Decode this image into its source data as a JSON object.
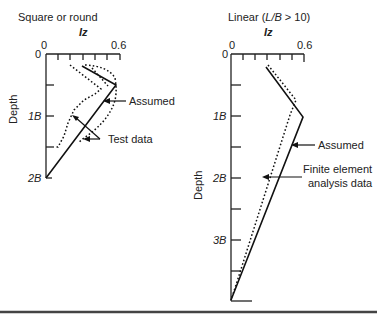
{
  "left_panel": {
    "title": "Square or round",
    "x_axis_label": "Iz",
    "x_ticks": {
      "start": "0",
      "end": "0.6"
    },
    "y_origin_label": "0",
    "y_axis_label": "Depth",
    "y_ticks": [
      "1B",
      "2B"
    ],
    "annotations": {
      "assumed": "Assumed",
      "test_data": "Test data"
    }
  },
  "right_panel": {
    "title": "Linear (L/B > 10)",
    "title_prefix": "Linear (",
    "title_italic": "L/B",
    "title_suffix": " > 10)",
    "x_axis_label": "Iz",
    "x_ticks": {
      "start": "0",
      "end": "0.6"
    },
    "y_origin_label": "0",
    "y_axis_label": "Depth",
    "y_ticks": [
      "1B",
      "2B",
      "3B"
    ],
    "annotations": {
      "assumed": "Assumed",
      "fem_line1": "Finite element",
      "fem_line2": "analysis data"
    }
  }
}
